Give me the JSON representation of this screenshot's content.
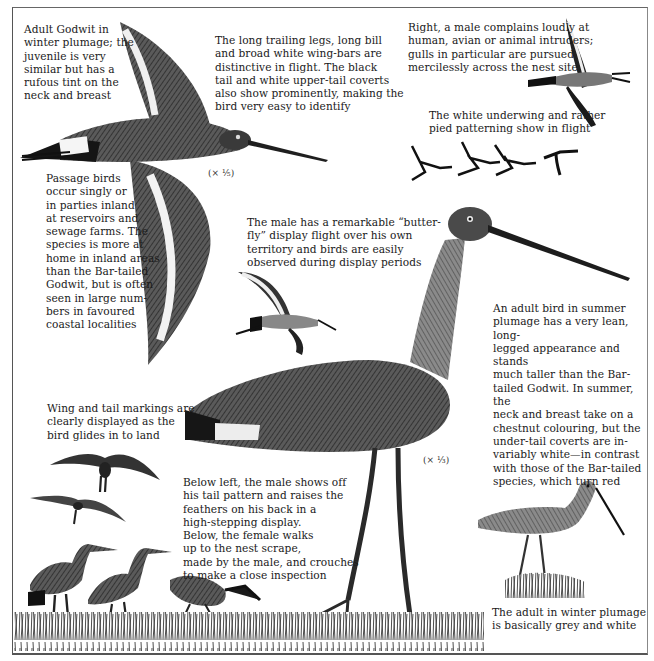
{
  "captions": {
    "winter_adult": "Adult Godwit in\nwinter plumage; the\njuvenile is very\nsimilar but has a\nrufous tint on the\nneck and breast",
    "trailing_legs": "The long trailing legs, long bill\nand broad white wing-bars are\ndistinctive in flight. The black\ntail and white upper-tail coverts\nalso show prominently, making the\nbird very easy to identify",
    "male_complains": "Right, a male complains loudly at\nhuman, avian or animal intruders;\ngulls in particular are pursued\nmercilessly across the nest site",
    "underwing": "The white underwing and rather\npied patterning show in flight",
    "passage_birds": "Passage birds\noccur singly or\nin parties inland\nat reservoirs and\nsewage farms. The\nspecies is more at\nhome in inland areas\nthan the Bar-tailed\nGodwit, but is often\nseen in large num-\nbers in favoured\ncoastal localities",
    "butterfly_display": "The male has a remarkable “butter-\nfly” display flight over his own\nterritory and birds are easily\nobserved during display periods",
    "summer_adult": "An adult bird in summer\nplumage has a very lean, long-\nlegged appearance and stands\nmuch taller than the Bar-\ntailed Godwit. In summer, the\nneck and breast take on a\nchestnut colouring, but the\nunder-tail coverts are in-\nvariably white—in contrast\nwith those of the Bar-tailed\nspecies, which turn red",
    "wing_tail_markings": "Wing and tail markings are\nclearly displayed as the\nbird glides in to land",
    "courtship": "Below left, the male shows off\nhis tail pattern and raises the\nfeathers on his back in a\nhigh-stepping display.\nBelow, the female walks\nup to the nest scrape,\nmade by the male, and crouches\nto make a close inspection",
    "winter_grey": "The adult in winter plumage\nis basically grey and white"
  },
  "scales": {
    "flying_bird": "(× ¹⁄₅)",
    "standing_bird": "(× ¹⁄₃)"
  },
  "colors": {
    "ink": "#1a1a1a",
    "plumage_dark": "#2b2b2b",
    "plumage_mid": "#6f6f6f",
    "plumage_light": "#b5b5b5",
    "paper": "#ffffff"
  }
}
